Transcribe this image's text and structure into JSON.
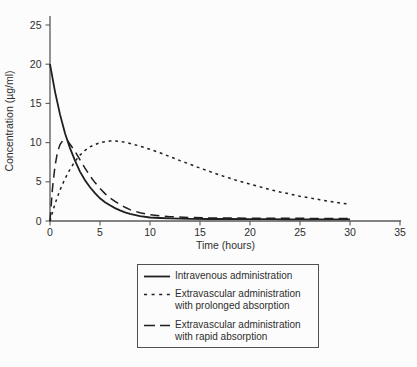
{
  "figure": {
    "background": "#fcfcfc",
    "ink_color": "#1f1f1f",
    "axis_color": "#5a5a5a",
    "text_color": "#2e2e2e"
  },
  "chart_data": {
    "type": "line",
    "title": "",
    "xlabel": "Time (hours)",
    "ylabel": "Concentration (µg/ml)",
    "xlim": [
      0,
      35
    ],
    "ylim": [
      0,
      25
    ],
    "x_ticks": [
      0,
      5,
      10,
      15,
      20,
      25,
      30,
      35
    ],
    "y_ticks": [
      0,
      5,
      10,
      15,
      20,
      25
    ],
    "grid": false,
    "legend_position": "boxed, below x-axis",
    "series": [
      {
        "id": "intravenous",
        "name": "Intravenous administration",
        "style": "solid",
        "points": [
          [
            0,
            20
          ],
          [
            0.5,
            16.5
          ],
          [
            1,
            13.6
          ],
          [
            1.5,
            11.2
          ],
          [
            2,
            9.3
          ],
          [
            2.5,
            7.7
          ],
          [
            3,
            6.3
          ],
          [
            3.5,
            5.2
          ],
          [
            4,
            4.3
          ],
          [
            4.5,
            3.55
          ],
          [
            5,
            2.9
          ],
          [
            5.5,
            2.4
          ],
          [
            6,
            2.0
          ],
          [
            6.5,
            1.65
          ],
          [
            7,
            1.35
          ],
          [
            7.5,
            1.1
          ],
          [
            8,
            0.92
          ],
          [
            9,
            0.63
          ],
          [
            10,
            0.45
          ],
          [
            11,
            0.38
          ],
          [
            12,
            0.33
          ],
          [
            14,
            0.28
          ],
          [
            16,
            0.26
          ],
          [
            18,
            0.25
          ],
          [
            20,
            0.24
          ],
          [
            22,
            0.23
          ],
          [
            24,
            0.22
          ],
          [
            26,
            0.22
          ],
          [
            28,
            0.21
          ],
          [
            30,
            0.21
          ]
        ]
      },
      {
        "id": "prolonged-absorption",
        "name": "Extravascular administration with prolonged absorption",
        "style": "dotted",
        "points": [
          [
            0,
            0
          ],
          [
            0.5,
            2.2
          ],
          [
            1,
            3.95
          ],
          [
            1.5,
            5.4
          ],
          [
            2,
            6.6
          ],
          [
            2.5,
            7.6
          ],
          [
            3,
            8.4
          ],
          [
            3.5,
            9.0
          ],
          [
            4,
            9.45
          ],
          [
            4.5,
            9.75
          ],
          [
            5,
            10.0
          ],
          [
            5.5,
            10.1
          ],
          [
            6,
            10.2
          ],
          [
            6.5,
            10.2
          ],
          [
            7,
            10.15
          ],
          [
            7.5,
            10.05
          ],
          [
            8,
            9.9
          ],
          [
            9,
            9.55
          ],
          [
            10,
            9.15
          ],
          [
            11,
            8.7
          ],
          [
            12,
            8.2
          ],
          [
            13,
            7.7
          ],
          [
            14,
            7.25
          ],
          [
            15,
            6.75
          ],
          [
            16,
            6.3
          ],
          [
            17,
            5.85
          ],
          [
            18,
            5.45
          ],
          [
            19,
            5.05
          ],
          [
            20,
            4.7
          ],
          [
            21,
            4.35
          ],
          [
            22,
            4.0
          ],
          [
            23,
            3.7
          ],
          [
            24,
            3.45
          ],
          [
            25,
            3.15
          ],
          [
            26,
            2.95
          ],
          [
            27,
            2.7
          ],
          [
            28,
            2.5
          ],
          [
            29,
            2.3
          ],
          [
            30,
            2.15
          ]
        ]
      },
      {
        "id": "rapid-absorption",
        "name": "Extravascular administration with rapid absorption",
        "style": "dashed",
        "points": [
          [
            0,
            0
          ],
          [
            0.25,
            4.2
          ],
          [
            0.5,
            7.0
          ],
          [
            0.75,
            8.8
          ],
          [
            1,
            9.75
          ],
          [
            1.25,
            10.2
          ],
          [
            1.5,
            10.35
          ],
          [
            1.75,
            10.25
          ],
          [
            2,
            9.8
          ],
          [
            2.5,
            8.9
          ],
          [
            3,
            7.8
          ],
          [
            3.5,
            6.75
          ],
          [
            4,
            5.75
          ],
          [
            4.5,
            4.9
          ],
          [
            5,
            4.15
          ],
          [
            5.5,
            3.5
          ],
          [
            6,
            2.95
          ],
          [
            6.5,
            2.5
          ],
          [
            7,
            2.1
          ],
          [
            7.5,
            1.75
          ],
          [
            8,
            1.45
          ],
          [
            9,
            1.05
          ],
          [
            10,
            0.8
          ],
          [
            11,
            0.65
          ],
          [
            12,
            0.55
          ],
          [
            14,
            0.45
          ],
          [
            16,
            0.4
          ],
          [
            18,
            0.38
          ],
          [
            20,
            0.36
          ],
          [
            22,
            0.35
          ],
          [
            24,
            0.34
          ],
          [
            26,
            0.33
          ],
          [
            28,
            0.32
          ],
          [
            30,
            0.32
          ]
        ]
      }
    ]
  },
  "legend": {
    "items": [
      {
        "style": "solid",
        "lines": [
          "Intravenous administration"
        ]
      },
      {
        "style": "dotted",
        "lines": [
          "Extravascular administration",
          "with prolonged absorption"
        ]
      },
      {
        "style": "dashed",
        "lines": [
          "Extravascular administration",
          "with rapid absorption"
        ]
      }
    ]
  }
}
